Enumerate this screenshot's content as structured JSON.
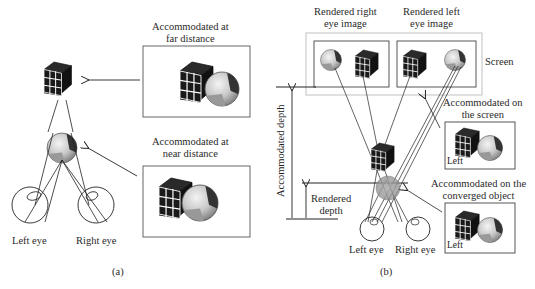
{
  "panel_a": {
    "caption": "(a)",
    "far_inset_title": [
      "Accommodated at",
      "far distance"
    ],
    "near_inset_title": [
      "Accommodated at",
      "near distance"
    ],
    "left_eye_label": "Left eye",
    "right_eye_label": "Right eye"
  },
  "panel_b": {
    "caption": "(b)",
    "right_eye_image_title": [
      "Rendered right",
      "eye image"
    ],
    "left_eye_image_title": [
      "Rendered left",
      "eye image"
    ],
    "screen_label": "Screen",
    "accommodated_depth_label": "Accommodated depth",
    "rendered_depth_label": [
      "Rendered",
      "depth"
    ],
    "on_screen_inset_title": [
      "Accommodated on",
      "the screen"
    ],
    "on_object_inset_title": [
      "Accommodated on the",
      "converged object"
    ],
    "inset_eye_tag": "Left",
    "left_eye_label": "Left eye",
    "right_eye_label": "Right eye"
  },
  "colors": {
    "line": "#222222",
    "frame": "#555555",
    "screen_frame": "#bbbbbb",
    "cube_dark": "#1c1c1c",
    "cube_grid": "#ffffff",
    "ball_light": "#e6e6e6",
    "ball_mid": "#a8a8a8",
    "ball_dark": "#333333"
  }
}
